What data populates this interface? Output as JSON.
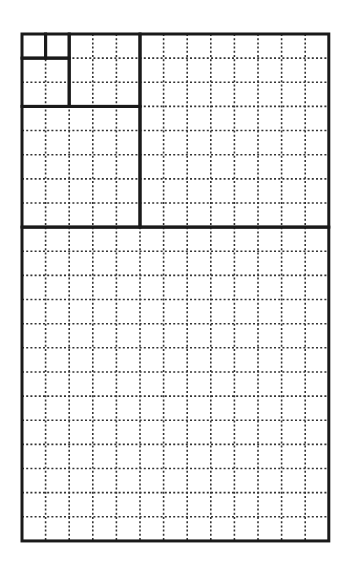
{
  "diagram": {
    "type": "fibonacci-grid",
    "grid_cols": 13,
    "grid_rows": 21,
    "origin": [
      22,
      34
    ],
    "cell_w": 23.6,
    "cell_h": 24.14,
    "colors": {
      "background": "#ffffff",
      "solid_line": "#1a1a1a",
      "dotted_line": "#333333"
    },
    "squares": [
      {
        "name": "square-1a",
        "col": 0,
        "row": 0,
        "size": 1
      },
      {
        "name": "square-1b",
        "col": 1,
        "row": 0,
        "size": 1
      },
      {
        "name": "square-2",
        "col": 0,
        "row": 1,
        "size": 2
      },
      {
        "name": "square-3",
        "col": 2,
        "row": 0,
        "size": 3
      },
      {
        "name": "square-5",
        "col": 0,
        "row": 3,
        "size": 5
      },
      {
        "name": "square-8",
        "col": 5,
        "row": 0,
        "size": 8
      },
      {
        "name": "square-13",
        "col": 0,
        "row": 8,
        "size": 13
      }
    ]
  }
}
